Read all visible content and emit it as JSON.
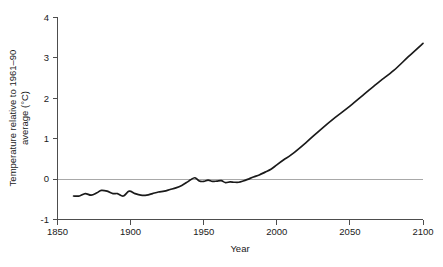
{
  "chart_data": {
    "type": "line",
    "title": "",
    "xlabel": "Year",
    "ylabel": "Temperature relative to 1961–90 average (°C)",
    "ylabel_line1": "Temperature relative to 1961–90",
    "ylabel_line2": "average (°C)",
    "xlim": [
      1850,
      2100
    ],
    "ylim": [
      -1,
      4
    ],
    "xticks": [
      1850,
      1900,
      1950,
      2000,
      2050,
      2100
    ],
    "yticks": [
      -1,
      0,
      1,
      2,
      3,
      4
    ],
    "xtick_labels": [
      "1850",
      "1900",
      "1950",
      "2000",
      "2050",
      "2100"
    ],
    "ytick_labels": [
      "-1",
      "0",
      "1",
      "2",
      "3",
      "4"
    ],
    "grid": false,
    "legend": false,
    "reference_line": {
      "y": 0,
      "color": "#a8a8a8"
    },
    "series": [
      {
        "name": "Global mean temperature anomaly",
        "color": "#1a1a1a",
        "x": [
          1861,
          1865,
          1869,
          1873,
          1877,
          1880,
          1884,
          1888,
          1891,
          1895,
          1899,
          1903,
          1907,
          1911,
          1915,
          1919,
          1923,
          1927,
          1931,
          1935,
          1939,
          1941,
          1944,
          1947,
          1950,
          1953,
          1956,
          1959,
          1962,
          1965,
          1968,
          1971,
          1974,
          1977,
          1980,
          1984,
          1988,
          1992,
          1996,
          2000,
          2005,
          2010,
          2020,
          2030,
          2040,
          2050,
          2060,
          2070,
          2080,
          2090,
          2100
        ],
        "y": [
          -0.42,
          -0.42,
          -0.36,
          -0.4,
          -0.34,
          -0.28,
          -0.3,
          -0.36,
          -0.36,
          -0.42,
          -0.3,
          -0.36,
          -0.4,
          -0.4,
          -0.36,
          -0.32,
          -0.3,
          -0.26,
          -0.22,
          -0.16,
          -0.07,
          -0.02,
          0.03,
          -0.05,
          -0.06,
          -0.03,
          -0.06,
          -0.05,
          -0.04,
          -0.09,
          -0.07,
          -0.08,
          -0.08,
          -0.05,
          -0.01,
          0.05,
          0.1,
          0.17,
          0.24,
          0.35,
          0.48,
          0.6,
          0.9,
          1.22,
          1.52,
          1.8,
          2.1,
          2.4,
          2.68,
          3.02,
          3.35
        ]
      }
    ]
  },
  "axes": {
    "x_axis_name": "Year",
    "y_axis_name": "Temperature relative to 1961–90 average (°C)"
  }
}
